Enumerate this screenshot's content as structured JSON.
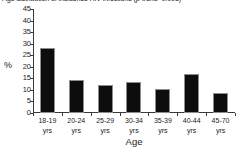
{
  "chart_data": {
    "type": "bar",
    "title": "Age distribution of incidence HIV infections (p-trend=0.008)",
    "xlabel": "Age",
    "ylabel": "%",
    "categories": [
      "18-19 yrs",
      "20-24 yrs",
      "25-29 yrs",
      "30-34 yrs",
      "35-39 yrs",
      "40-44 yrs",
      "45-70 yrs"
    ],
    "category_lines": [
      [
        "18-19",
        "yrs"
      ],
      [
        "20-24",
        "yrs"
      ],
      [
        "25-29",
        "yrs"
      ],
      [
        "30-34",
        "yrs"
      ],
      [
        "35-39",
        "yrs"
      ],
      [
        "40-44",
        "yrs"
      ],
      [
        "45-70",
        "yrs"
      ]
    ],
    "values": [
      28.0,
      14.2,
      12.0,
      13.6,
      10.3,
      17.0,
      8.5
    ],
    "ylim": [
      0,
      45
    ],
    "yticks": [
      0,
      5,
      10,
      15,
      20,
      25,
      30,
      35,
      40,
      45
    ],
    "ytick_labels": [
      "0",
      "5",
      "10",
      "15",
      "20",
      "25",
      "30",
      "35",
      "40",
      "45"
    ],
    "grid": false,
    "legend": null,
    "bar_color": "#0d0d0d",
    "bar_edge_color": "#8d8d8d",
    "axis_color": "#3a3a3a",
    "background_color": "#ffffff"
  }
}
